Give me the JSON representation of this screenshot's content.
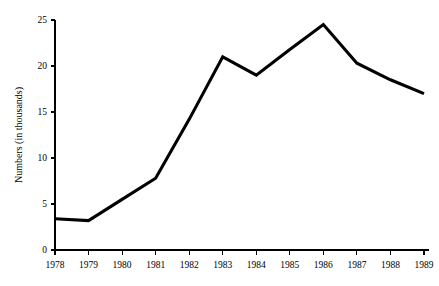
{
  "chart_data": {
    "type": "line",
    "title": "",
    "subtitle": "",
    "xlabel": "",
    "ylabel": "Numbers (in thousands)",
    "categories": [
      "1978",
      "1979",
      "1980",
      "1981",
      "1982",
      "1983",
      "1984",
      "1985",
      "1986",
      "1987",
      "1988",
      "1989"
    ],
    "x": [
      1978,
      1979,
      1980,
      1981,
      1982,
      1983,
      1984,
      1985,
      1986,
      1987,
      1988,
      1989
    ],
    "values": [
      3.4,
      3.2,
      5.5,
      7.8,
      14.2,
      21.0,
      19.0,
      21.8,
      24.5,
      20.3,
      18.5,
      17.0
    ],
    "series": [
      {
        "name": "Numbers",
        "color": "#000000",
        "values": [
          3.4,
          3.2,
          5.5,
          7.8,
          14.2,
          21.0,
          19.0,
          21.8,
          24.5,
          20.3,
          18.5,
          17.0
        ]
      }
    ],
    "ylim": [
      0,
      25
    ],
    "xlim": [
      1978,
      1989
    ],
    "yticks": [
      0,
      5,
      10,
      15,
      20,
      25
    ],
    "ytick_labels": [
      "0",
      "5",
      "10",
      "15",
      "20",
      "25"
    ],
    "xtick_labels": [
      "1978",
      "1979",
      "1980",
      "1981",
      "1982",
      "1983",
      "1984",
      "1985",
      "1986",
      "1987",
      "1988",
      "1989"
    ],
    "grid": false,
    "legend": false,
    "legend_position": "none",
    "markers": false,
    "annotations": []
  },
  "axes": {
    "y_axis_title": "Numbers (in thousands)"
  }
}
